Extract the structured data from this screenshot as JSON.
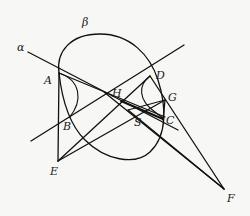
{
  "diagram": {
    "type": "projective-geometry-figure",
    "colors": {
      "background": "#f7f7f5",
      "stroke": "#111111",
      "label": "#1a1a1a"
    },
    "labels": {
      "alpha": "α",
      "beta": "β",
      "A": "A",
      "B": "B",
      "C": "C",
      "D": "D",
      "E": "E",
      "F": "F",
      "G": "G",
      "H": "H",
      "S": "S"
    },
    "points": {
      "A": [
        59,
        73
      ],
      "B": [
        60,
        123
      ],
      "C": [
        163,
        117
      ],
      "D": [
        150,
        76
      ],
      "E": [
        58,
        161
      ],
      "F": [
        224,
        189
      ],
      "G": [
        165,
        100
      ],
      "H": [
        121,
        101
      ],
      "S": [
        140,
        110
      ]
    },
    "curves": [
      {
        "name": "conic-beta",
        "kind": "closed oval"
      },
      {
        "name": "line-alpha",
        "kind": "line through A"
      }
    ]
  }
}
